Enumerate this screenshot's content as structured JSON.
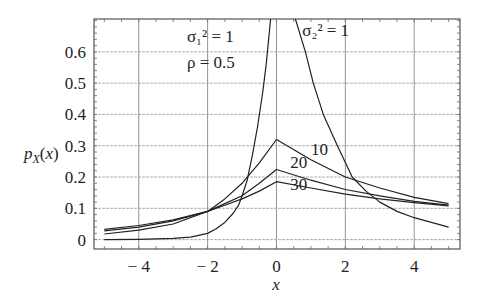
{
  "chart_data": {
    "type": "line",
    "title": "",
    "xlabel": "x",
    "ylabel": "p_X(x)",
    "xlim": [
      -5.3,
      5.33
    ],
    "ylim": [
      -0.03,
      0.705
    ],
    "grid": true,
    "x_ticks": [
      -4,
      -2,
      0,
      2,
      4
    ],
    "x_tick_labels": [
      "− 4",
      "− 2",
      "0",
      "2",
      "4"
    ],
    "y_ticks": [
      0,
      0.1,
      0.2,
      0.3,
      0.4,
      0.5,
      0.6
    ],
    "y_tick_labels": [
      "0",
      "0.1",
      "0.2",
      "0.3",
      "0.4",
      "0.5",
      "0.6"
    ],
    "legend": null,
    "annotations": [
      {
        "text": "σ₁² = 1",
        "x": -2.6,
        "y": 0.63
      },
      {
        "text": "ρ = 0.5",
        "x": -2.6,
        "y": 0.55
      },
      {
        "text": "σ₂² = 1",
        "x": 0.75,
        "y": 0.65
      },
      {
        "text": "10",
        "x": 1.0,
        "y": 0.27
      },
      {
        "text": "20",
        "x": 0.4,
        "y": 0.23
      },
      {
        "text": "30",
        "x": 0.4,
        "y": 0.16
      }
    ],
    "series": [
      {
        "name": "σ₂² = 1",
        "x": [
          -5,
          -4,
          -3,
          -2.5,
          -2,
          -1.75,
          -1.5,
          -1.25,
          -1.1,
          -1.0,
          -0.85,
          -0.7,
          -0.55,
          -0.4,
          -0.3,
          -0.17,
          -0.1,
          0.2,
          0.55,
          0.84,
          1.07,
          1.36,
          1.77,
          2.2,
          2.6,
          3.0,
          3.5,
          4.0,
          4.5,
          5.0
        ],
        "y": [
          0.0,
          0.001,
          0.004,
          0.008,
          0.02,
          0.035,
          0.055,
          0.085,
          0.11,
          0.14,
          0.19,
          0.27,
          0.36,
          0.47,
          0.56,
          0.705,
          0.76,
          0.9,
          0.705,
          0.6,
          0.5,
          0.4,
          0.3,
          0.2,
          0.155,
          0.12,
          0.09,
          0.07,
          0.055,
          0.04
        ]
      },
      {
        "name": "10",
        "x": [
          -5,
          -4,
          -3,
          -2,
          -1.5,
          -1,
          -0.5,
          0,
          1,
          2,
          3,
          4,
          5
        ],
        "y": [
          0.018,
          0.03,
          0.05,
          0.09,
          0.13,
          0.18,
          0.245,
          0.32,
          0.255,
          0.2,
          0.165,
          0.135,
          0.115
        ]
      },
      {
        "name": "20",
        "x": [
          -5,
          -4,
          -3,
          -2,
          -1.5,
          -1,
          -0.5,
          0,
          1,
          2,
          3,
          4,
          5
        ],
        "y": [
          0.028,
          0.04,
          0.06,
          0.09,
          0.115,
          0.14,
          0.18,
          0.224,
          0.19,
          0.16,
          0.14,
          0.122,
          0.11
        ]
      },
      {
        "name": "30",
        "x": [
          -5,
          -4,
          -3,
          -2,
          -1.5,
          -1,
          -0.5,
          0,
          1,
          2,
          3,
          4,
          5
        ],
        "y": [
          0.033,
          0.045,
          0.063,
          0.09,
          0.11,
          0.13,
          0.155,
          0.185,
          0.165,
          0.145,
          0.13,
          0.118,
          0.108
        ]
      }
    ]
  }
}
